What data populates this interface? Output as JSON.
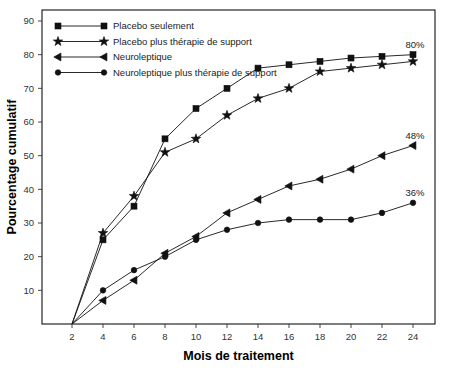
{
  "chart_data": {
    "type": "line",
    "title": "",
    "xlabel": "Mois de traitement",
    "ylabel": "Pourcentage cumulatif",
    "x": [
      2,
      4,
      6,
      8,
      10,
      12,
      14,
      16,
      18,
      20,
      22,
      24
    ],
    "xticklabels": [
      "2",
      "4",
      "6",
      "8",
      "10",
      "12",
      "14",
      "16",
      "18",
      "20",
      "22",
      "24"
    ],
    "yticklabels": [
      "10",
      "20",
      "30",
      "40",
      "50",
      "60",
      "70",
      "80",
      "90"
    ],
    "yticks": [
      10,
      20,
      30,
      40,
      50,
      60,
      70,
      80,
      90
    ],
    "xlim": [
      2,
      25
    ],
    "ylim": [
      0,
      94
    ],
    "grid": false,
    "legend_position": "top-left",
    "series": [
      {
        "name": "Placebo seulement",
        "marker": "square",
        "values": [
          0,
          25,
          35,
          55,
          64,
          70,
          76,
          77,
          78,
          79,
          79.5,
          80
        ]
      },
      {
        "name": "Placebo plus thérapie de support",
        "marker": "star",
        "values": [
          0,
          27,
          38,
          51,
          55,
          62,
          67,
          70,
          75,
          76,
          77,
          78
        ]
      },
      {
        "name": "Neuroleptique",
        "marker": "triangle",
        "values": [
          0,
          7,
          13,
          21,
          26,
          33,
          37,
          41,
          43,
          46,
          50,
          53
        ]
      },
      {
        "name": "Neuroleptique plus thérapie de support",
        "marker": "circle",
        "values": [
          0,
          10,
          16,
          20,
          25,
          28,
          30,
          31,
          31,
          31,
          33,
          36
        ]
      }
    ],
    "annotations": [
      {
        "text": "80%",
        "series": "Placebo seulement",
        "x": 24,
        "y": 80
      },
      {
        "text": "48%",
        "series": "Neuroleptique",
        "x": 24,
        "y": 53
      },
      {
        "text": "36%",
        "series": "Neuroleptique plus thérapie de support",
        "x": 24,
        "y": 36
      }
    ],
    "colors": {
      "ink": "#111111",
      "background": "#ffffff"
    }
  },
  "legend": {
    "items": [
      {
        "label": "Placebo seulement",
        "marker": "square"
      },
      {
        "label": "Placebo plus thérapie de support",
        "marker": "star"
      },
      {
        "label": "Neuroleptique",
        "marker": "triangle"
      },
      {
        "label": "Neuroleptique plus thérapie de support",
        "marker": "circle"
      }
    ]
  }
}
